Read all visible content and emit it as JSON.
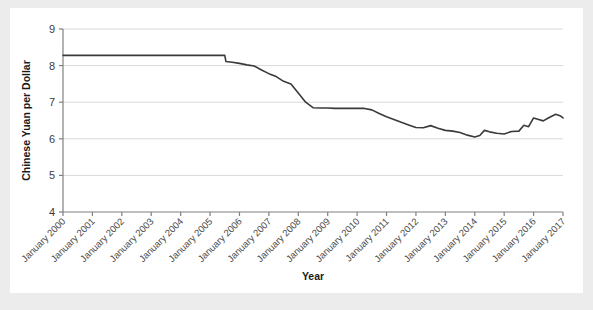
{
  "chart_data": {
    "type": "line",
    "title": "",
    "subtitle": "",
    "xlabel": "Year",
    "ylabel": "Chinese Yuan per Dollar",
    "xlim": [
      2000,
      2017
    ],
    "ylim": [
      4,
      9
    ],
    "grid": true,
    "grid_axis": "y",
    "legend": "none",
    "line_color": "#3a3a3a",
    "panel_color": "#ffffff",
    "frame_color": "#ececec",
    "gridline_color": "#d9d9d9",
    "axis_color": "#808080",
    "ytick_labels": [
      "4",
      "5",
      "6",
      "7",
      "8",
      "9"
    ],
    "ytick_values": [
      4,
      5,
      6,
      7,
      8,
      9
    ],
    "xtick_labels": [
      "January 2000",
      "January 2001",
      "January 2002",
      "January 2003",
      "January 2004",
      "January 2005",
      "January 2006",
      "January 2007",
      "January 2008",
      "January 2009",
      "January 2010",
      "January 2011",
      "January 2012",
      "January 2013",
      "January 2014",
      "January 2015",
      "January 2016",
      "January 2017"
    ],
    "xtick_values": [
      2000,
      2001,
      2002,
      2003,
      2004,
      2005,
      2006,
      2007,
      2008,
      2009,
      2010,
      2011,
      2012,
      2013,
      2014,
      2015,
      2016,
      2017
    ],
    "series": [
      {
        "name": "Chinese Yuan per Dollar",
        "x": [
          2000.0,
          2000.25,
          2000.5,
          2000.75,
          2001.0,
          2001.25,
          2001.5,
          2001.75,
          2002.0,
          2002.25,
          2002.5,
          2002.75,
          2003.0,
          2003.25,
          2003.5,
          2003.75,
          2004.0,
          2004.25,
          2004.5,
          2004.75,
          2005.0,
          2005.25,
          2005.5,
          2005.54,
          2005.75,
          2006.0,
          2006.25,
          2006.5,
          2006.75,
          2007.0,
          2007.25,
          2007.5,
          2007.75,
          2008.0,
          2008.25,
          2008.5,
          2008.75,
          2009.0,
          2009.25,
          2009.5,
          2009.75,
          2010.0,
          2010.25,
          2010.5,
          2010.75,
          2011.0,
          2011.25,
          2011.5,
          2011.75,
          2012.0,
          2012.25,
          2012.5,
          2012.75,
          2013.0,
          2013.25,
          2013.5,
          2013.75,
          2014.0,
          2014.17,
          2014.33,
          2014.5,
          2014.75,
          2015.0,
          2015.25,
          2015.5,
          2015.67,
          2015.83,
          2016.0,
          2016.17,
          2016.33,
          2016.5,
          2016.75,
          2016.92,
          2017.0
        ],
        "y": [
          8.28,
          8.28,
          8.28,
          8.28,
          8.28,
          8.28,
          8.28,
          8.28,
          8.28,
          8.28,
          8.28,
          8.28,
          8.28,
          8.28,
          8.28,
          8.28,
          8.28,
          8.28,
          8.28,
          8.28,
          8.28,
          8.28,
          8.28,
          8.11,
          8.09,
          8.06,
          8.02,
          7.99,
          7.88,
          7.78,
          7.7,
          7.57,
          7.5,
          7.25,
          7.0,
          6.85,
          6.84,
          6.84,
          6.83,
          6.83,
          6.83,
          6.83,
          6.83,
          6.79,
          6.69,
          6.6,
          6.53,
          6.45,
          6.38,
          6.31,
          6.3,
          6.36,
          6.29,
          6.23,
          6.21,
          6.17,
          6.1,
          6.05,
          6.09,
          6.23,
          6.19,
          6.15,
          6.13,
          6.2,
          6.21,
          6.37,
          6.33,
          6.57,
          6.53,
          6.49,
          6.57,
          6.67,
          6.62,
          6.57
        ]
      }
    ]
  },
  "axis": {
    "y_title": "Chinese Yuan per Dollar",
    "x_title": "Year"
  }
}
